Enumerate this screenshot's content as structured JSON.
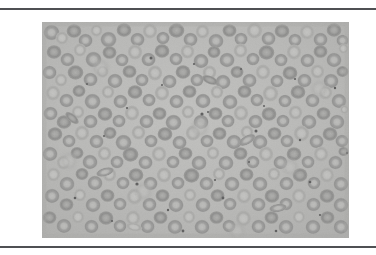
{
  "page": {
    "background_color": "#ffffff",
    "width": 376,
    "height": 255
  },
  "rules": {
    "color": "#4f5053",
    "top_label": "",
    "bottom_label": ""
  },
  "figure": {
    "caption": "",
    "alt_description": "Light micrograph of a peripheral blood smear showing numerous ring-shaped erythrocytes (red blood cells) with pale central pallor on a uniform gray background",
    "image_kind": "blood-smear-micrograph",
    "stain": "",
    "magnification_label": "",
    "scale_bar_label": "",
    "frame": {
      "x": 42,
      "y": 22,
      "width": 307,
      "height": 216,
      "border": "none"
    },
    "palette": {
      "plasma_background": "#b9b9b7",
      "plasma_background_light": "#c2c2c0",
      "plasma_background_dark": "#aeaeac",
      "cell_membrane": "#9a9a99",
      "cell_membrane_dark": "#8c8c8b",
      "cell_center": "#b4b4b2",
      "cell_center_pale": "#bfbfbd",
      "speck_dark": "#606060",
      "vignette": "#a5a5a3"
    },
    "content_stats": {
      "approx_cell_count": 300,
      "cell_shape": "biconcave disc / annulus",
      "dark_speck_count": 26
    }
  }
}
